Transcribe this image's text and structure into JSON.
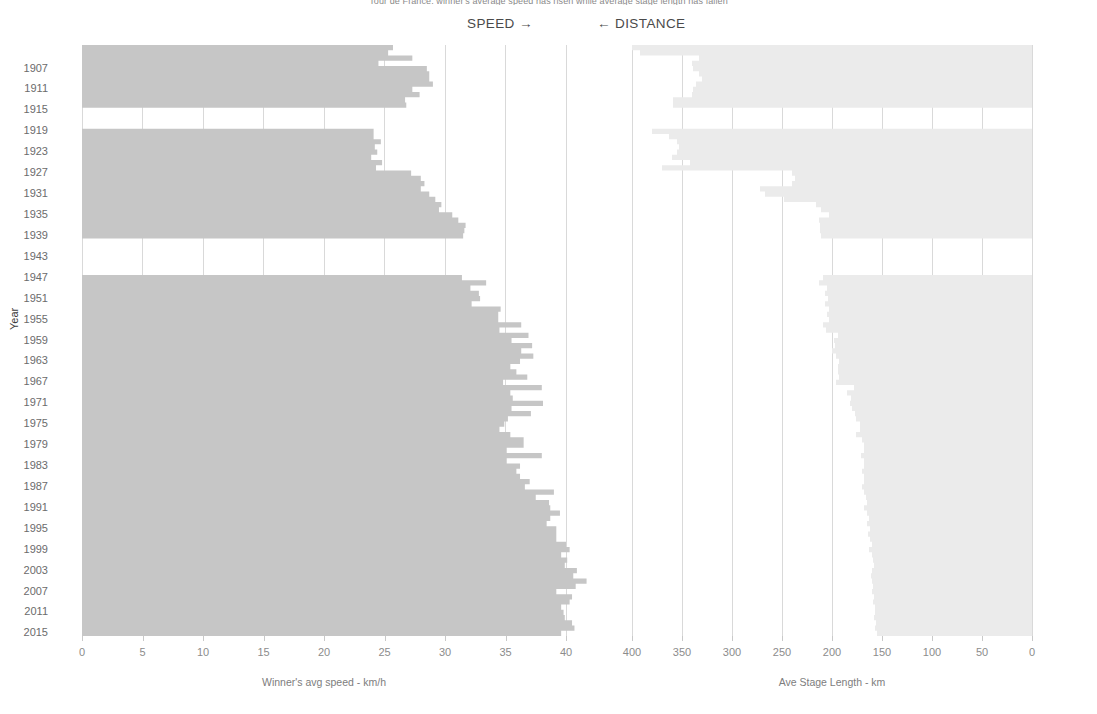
{
  "title": "Tour de France: winner's average speed has risen while average stage length has fallen",
  "direction_labels": {
    "speed": "SPEED →",
    "distance": "← DISTANCE"
  },
  "y_axis_title": "Year",
  "colors": {
    "speed_fill": "#c6c6c6",
    "distance_fill": "#ebebeb",
    "gridline": "#d9d9d9",
    "text": "#6b6b6b",
    "background": "#ffffff"
  },
  "year_tick_labels": [
    "1907",
    "1911",
    "1915",
    "1919",
    "1923",
    "1927",
    "1931",
    "1935",
    "1939",
    "1943",
    "1947",
    "1951",
    "1955",
    "1959",
    "1963",
    "1967",
    "1971",
    "1975",
    "1979",
    "1983",
    "1987",
    "1991",
    "1995",
    "1999",
    "2003",
    "2007",
    "2011",
    "2015"
  ],
  "chart_data": [
    {
      "type": "area",
      "orientation": "horizontal",
      "title": "Winner's avg speed",
      "xlabel": "Winner's avg speed - km/h",
      "ylabel": "Year",
      "xlim": [
        0,
        40
      ],
      "xticks": [
        0,
        5,
        10,
        15,
        20,
        25,
        30,
        35,
        40
      ],
      "x_reversed": false,
      "grid": true,
      "legend": "none",
      "y": [
        1903,
        1904,
        1905,
        1906,
        1907,
        1908,
        1909,
        1910,
        1911,
        1912,
        1913,
        1914,
        1919,
        1920,
        1921,
        1922,
        1923,
        1924,
        1925,
        1926,
        1927,
        1928,
        1929,
        1930,
        1931,
        1932,
        1933,
        1934,
        1935,
        1936,
        1937,
        1938,
        1939,
        1947,
        1948,
        1949,
        1950,
        1951,
        1952,
        1953,
        1954,
        1955,
        1956,
        1957,
        1958,
        1959,
        1960,
        1961,
        1962,
        1963,
        1964,
        1965,
        1966,
        1967,
        1968,
        1969,
        1970,
        1971,
        1972,
        1973,
        1974,
        1975,
        1976,
        1977,
        1978,
        1979,
        1980,
        1981,
        1982,
        1983,
        1984,
        1985,
        1986,
        1987,
        1988,
        1989,
        1990,
        1991,
        1992,
        1993,
        1994,
        1995,
        1996,
        1997,
        1998,
        1999,
        2000,
        2001,
        2002,
        2003,
        2004,
        2005,
        2006,
        2007,
        2008,
        2009,
        2010,
        2011,
        2012,
        2013,
        2014,
        2015
      ],
      "values": [
        25.7,
        25.3,
        27.3,
        24.5,
        28.5,
        28.7,
        28.7,
        29.0,
        27.3,
        27.9,
        26.7,
        26.8,
        24.1,
        24.1,
        24.7,
        24.2,
        24.4,
        23.9,
        24.8,
        24.3,
        27.2,
        28.0,
        28.3,
        28.0,
        28.7,
        29.2,
        29.7,
        29.5,
        30.6,
        31.1,
        31.7,
        31.6,
        31.5,
        31.4,
        33.4,
        32.1,
        32.8,
        32.9,
        32.2,
        34.6,
        34.4,
        34.4,
        36.3,
        34.5,
        36.9,
        35.5,
        37.2,
        36.3,
        37.3,
        36.2,
        35.4,
        35.9,
        36.8,
        34.8,
        38.0,
        35.4,
        35.6,
        38.1,
        35.5,
        37.1,
        35.2,
        34.9,
        34.5,
        35.4,
        36.5,
        36.5,
        35.1,
        38.0,
        35.1,
        36.2,
        35.9,
        36.2,
        37.0,
        36.6,
        39.0,
        37.5,
        38.6,
        38.7,
        39.5,
        38.7,
        38.4,
        39.2,
        39.2,
        39.2,
        40.0,
        40.3,
        39.6,
        40.1,
        39.9,
        40.9,
        40.6,
        41.7,
        40.8,
        39.2,
        40.5,
        40.3,
        39.6,
        39.8,
        39.9,
        40.5,
        40.7,
        39.6
      ]
    },
    {
      "type": "area",
      "orientation": "horizontal",
      "title": "Ave Stage Length",
      "xlabel": "Ave Stage Length - km",
      "ylabel": "Year",
      "xlim": [
        0,
        400
      ],
      "xticks": [
        400,
        350,
        300,
        250,
        200,
        150,
        100,
        50,
        0
      ],
      "x_reversed": true,
      "grid": true,
      "legend": "none",
      "y": [
        1903,
        1904,
        1905,
        1906,
        1907,
        1908,
        1909,
        1910,
        1911,
        1912,
        1913,
        1914,
        1919,
        1920,
        1921,
        1922,
        1923,
        1924,
        1925,
        1926,
        1927,
        1928,
        1929,
        1930,
        1931,
        1932,
        1933,
        1934,
        1935,
        1936,
        1937,
        1938,
        1939,
        1947,
        1948,
        1949,
        1950,
        1951,
        1952,
        1953,
        1954,
        1955,
        1956,
        1957,
        1958,
        1959,
        1960,
        1961,
        1962,
        1963,
        1964,
        1965,
        1966,
        1967,
        1968,
        1969,
        1970,
        1971,
        1972,
        1973,
        1974,
        1975,
        1976,
        1977,
        1978,
        1979,
        1980,
        1981,
        1982,
        1983,
        1984,
        1985,
        1986,
        1987,
        1988,
        1989,
        1990,
        1991,
        1992,
        1993,
        1994,
        1995,
        1996,
        1997,
        1998,
        1999,
        2000,
        2001,
        2002,
        2003,
        2004,
        2005,
        2006,
        2007,
        2008,
        2009,
        2010,
        2011,
        2012,
        2013,
        2014,
        2015
      ],
      "values": [
        400,
        392,
        333,
        340,
        339,
        333,
        330,
        336,
        339,
        340,
        359,
        359,
        380,
        363,
        355,
        353,
        355,
        360,
        342,
        370,
        240,
        237,
        240,
        272,
        267,
        248,
        216,
        211,
        203,
        213,
        212,
        212,
        211,
        209,
        213,
        205,
        207,
        204,
        207,
        203,
        205,
        203,
        209,
        206,
        194,
        198,
        197,
        200,
        196,
        193,
        194,
        194,
        193,
        196,
        178,
        185,
        181,
        182,
        180,
        177,
        176,
        172,
        172,
        176,
        170,
        168,
        168,
        171,
        168,
        168,
        170,
        168,
        168,
        170,
        168,
        166,
        165,
        168,
        165,
        163,
        165,
        162,
        164,
        162,
        160,
        163,
        160,
        159,
        158,
        160,
        161,
        160,
        159,
        160,
        158,
        159,
        157,
        157,
        158,
        156,
        157,
        155
      ]
    }
  ]
}
